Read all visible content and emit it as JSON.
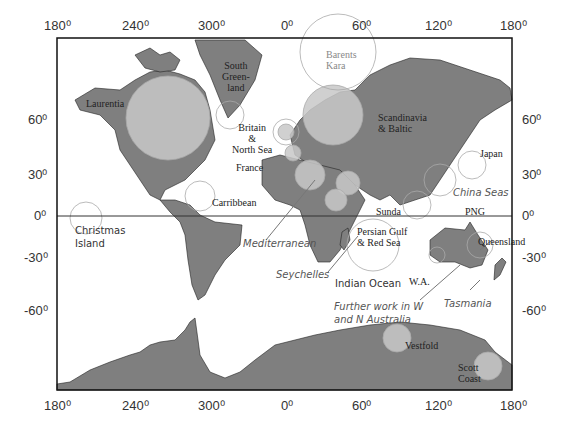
{
  "map": {
    "top_ticks": [
      "180⁰",
      "240⁰",
      "300⁰",
      "0⁰",
      "60⁰",
      "120⁰",
      "180⁰"
    ],
    "bottom_ticks": [
      "180⁰",
      "240⁰",
      "300⁰",
      "0⁰",
      "60⁰",
      "120⁰",
      "180⁰"
    ],
    "left_ticks": [
      "60⁰",
      "30⁰",
      "0⁰",
      "-30⁰",
      "-60⁰"
    ],
    "right_ticks": [
      "60⁰",
      "30⁰",
      "0⁰",
      "-30⁰",
      "-60⁰"
    ],
    "colors": {
      "land": "#7f7f7f",
      "circle_fill": "#c8c8c8",
      "circle_stroke": "#aaaaaa",
      "frame": "#111111"
    }
  },
  "regions": {
    "laurentia": "Laurentia",
    "south_greenland": [
      "South",
      "Green-",
      "land"
    ],
    "barents_kara": [
      "Barents",
      "Kara"
    ],
    "britain": [
      "Britain",
      "&",
      "North Sea"
    ],
    "scandinavia": [
      "Scandinavia",
      "& Baltic"
    ],
    "france": "France",
    "japan": "Japan",
    "china_seas": "China Seas",
    "carribbean": "Carribbean",
    "christmas_island": [
      "Christmas",
      "Island"
    ],
    "sunda": "Sunda",
    "png": "PNG",
    "mediterranean": "Mediterranean",
    "persian_gulf": [
      "Persian Gulf",
      "& Red Sea"
    ],
    "queensland": "Queensland",
    "seychelles": "Seychelles",
    "indian_ocean": "Indian Ocean",
    "wa": "W.A.",
    "further_work": [
      "Further work in W",
      "and N Australia"
    ],
    "tasmania": "Tasmania",
    "vestfold": "Vestfold",
    "scott_coast": [
      "Scott",
      "Coast"
    ]
  }
}
